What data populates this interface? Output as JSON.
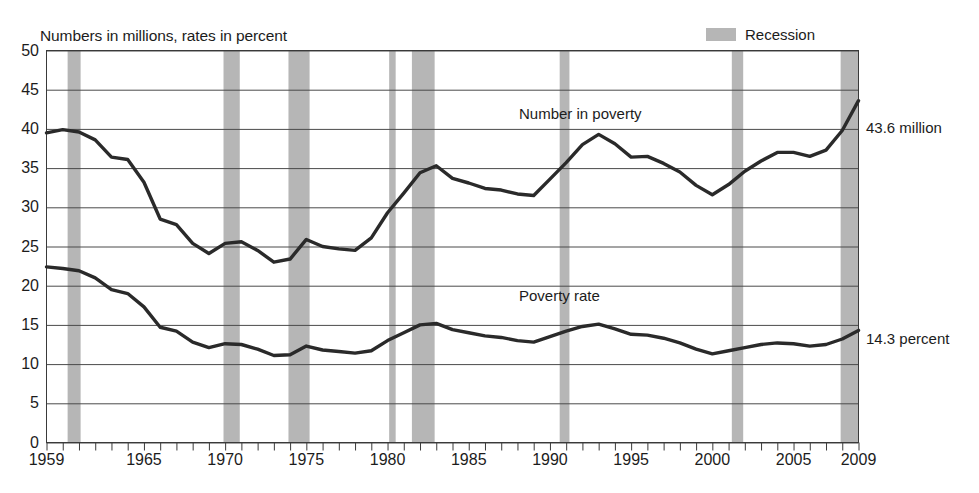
{
  "subtitle": "Numbers in millions, rates in percent",
  "legend": {
    "recession_label": "Recession",
    "recession_color": "#b6b6b6"
  },
  "annotations": {
    "number_in_poverty": "Number in poverty",
    "poverty_rate": "Poverty rate",
    "end_number": "43.6 million",
    "end_rate": "14.3 percent"
  },
  "axes": {
    "y_ticks": [
      "0",
      "5",
      "10",
      "15",
      "20",
      "25",
      "30",
      "35",
      "40",
      "45",
      "50"
    ],
    "x_ticks": [
      "1959",
      "1965",
      "1970",
      "1975",
      "1980",
      "1985",
      "1990",
      "1995",
      "2000",
      "2005",
      "2009"
    ]
  },
  "chart_data": {
    "type": "line",
    "title": "",
    "subtitle": "Numbers in millions, rates in percent",
    "xlabel": "",
    "ylabel": "Numbers in millions, rates in percent",
    "ylim": [
      0,
      50
    ],
    "xlim": [
      1959,
      2009
    ],
    "grid": true,
    "legend_position": "top-right",
    "x": [
      1959,
      1960,
      1961,
      1962,
      1963,
      1964,
      1965,
      1966,
      1967,
      1968,
      1969,
      1970,
      1971,
      1972,
      1973,
      1974,
      1975,
      1976,
      1977,
      1978,
      1979,
      1980,
      1981,
      1982,
      1983,
      1984,
      1985,
      1986,
      1987,
      1988,
      1989,
      1990,
      1991,
      1992,
      1993,
      1994,
      1995,
      1996,
      1997,
      1998,
      1999,
      2000,
      2001,
      2002,
      2003,
      2004,
      2005,
      2006,
      2007,
      2008,
      2009
    ],
    "series": [
      {
        "name": "Number in poverty",
        "units": "millions",
        "end_value": 43.6,
        "end_label": "43.6 million",
        "values": [
          39.5,
          39.9,
          39.6,
          38.6,
          36.4,
          36.1,
          33.2,
          28.5,
          27.8,
          25.4,
          24.1,
          25.4,
          25.6,
          24.5,
          23.0,
          23.4,
          25.9,
          25.0,
          24.7,
          24.5,
          26.1,
          29.3,
          31.8,
          34.4,
          35.3,
          33.7,
          33.1,
          32.4,
          32.2,
          31.7,
          31.5,
          33.6,
          35.7,
          38.0,
          39.3,
          38.1,
          36.4,
          36.5,
          35.6,
          34.5,
          32.8,
          31.6,
          32.9,
          34.6,
          35.9,
          37.0,
          37.0,
          36.5,
          37.3,
          39.8,
          43.6
        ]
      },
      {
        "name": "Poverty rate",
        "units": "percent",
        "end_value": 14.3,
        "end_label": "14.3 percent",
        "values": [
          22.4,
          22.2,
          21.9,
          21.0,
          19.5,
          19.0,
          17.3,
          14.7,
          14.2,
          12.8,
          12.1,
          12.6,
          12.5,
          11.9,
          11.1,
          11.2,
          12.3,
          11.8,
          11.6,
          11.4,
          11.7,
          13.0,
          14.0,
          15.0,
          15.2,
          14.4,
          14.0,
          13.6,
          13.4,
          13.0,
          12.8,
          13.5,
          14.2,
          14.8,
          15.1,
          14.5,
          13.8,
          13.7,
          13.3,
          12.7,
          11.9,
          11.3,
          11.7,
          12.1,
          12.5,
          12.7,
          12.6,
          12.3,
          12.5,
          13.2,
          14.3
        ]
      }
    ],
    "recession_bands": [
      {
        "start": 1960.3,
        "end": 1961.1
      },
      {
        "start": 1969.9,
        "end": 1970.9
      },
      {
        "start": 1973.9,
        "end": 1975.2
      },
      {
        "start": 1980.1,
        "end": 1980.5
      },
      {
        "start": 1981.5,
        "end": 1982.9
      },
      {
        "start": 1990.6,
        "end": 1991.2
      },
      {
        "start": 2001.2,
        "end": 2001.9
      },
      {
        "start": 2007.9,
        "end": 2009.5
      }
    ]
  }
}
